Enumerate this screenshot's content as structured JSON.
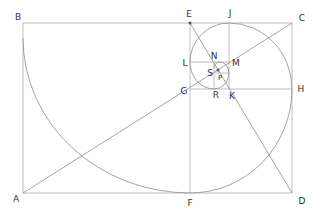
{
  "diagram": {
    "type": "golden-rectangle-spiral",
    "points": [
      {
        "id": "A",
        "label": "A",
        "x": 16,
        "y": 199
      },
      {
        "id": "B",
        "label": "B",
        "x": 18,
        "y": 17
      },
      {
        "id": "C",
        "label": "C",
        "x": 302,
        "y": 18
      },
      {
        "id": "D",
        "label": "D",
        "x": 302,
        "y": 201
      },
      {
        "id": "E",
        "label": "E",
        "x": 189,
        "y": 14
      },
      {
        "id": "F",
        "label": "F",
        "x": 190,
        "y": 203
      },
      {
        "id": "G",
        "label": "G",
        "x": 184,
        "y": 91
      },
      {
        "id": "H",
        "label": "H",
        "x": 301,
        "y": 89
      },
      {
        "id": "J",
        "label": "J",
        "x": 230,
        "y": 13
      },
      {
        "id": "K",
        "label": "K",
        "x": 232,
        "y": 96
      },
      {
        "id": "L",
        "label": "L",
        "x": 185,
        "y": 63
      },
      {
        "id": "M",
        "label": "M",
        "x": 236,
        "y": 63
      },
      {
        "id": "N",
        "label": "N",
        "x": 214,
        "y": 56
      },
      {
        "id": "P",
        "label": "P",
        "x": 220,
        "y": 78
      },
      {
        "id": "R",
        "label": "R",
        "x": 216,
        "y": 95
      },
      {
        "id": "S",
        "label": "S",
        "x": 210,
        "y": 73
      }
    ],
    "line_color": "#a8a8a8",
    "curve_color": "#9a9a9a",
    "label_color": "#333333"
  }
}
